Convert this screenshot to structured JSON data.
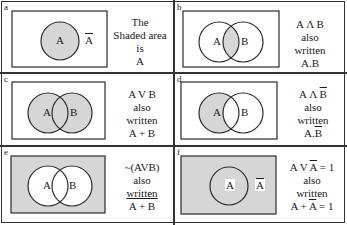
{
  "colors": {
    "shade": "#d6d6d6",
    "line": "#2a2a2a",
    "background": "#ffffff"
  },
  "panels": [
    {
      "id": "a",
      "label": "a",
      "sets": [
        "A"
      ],
      "complement_label": "A",
      "caption": [
        "The",
        "Shaded area",
        "is",
        "A"
      ],
      "shaded": "A"
    },
    {
      "id": "b",
      "label": "b",
      "sets": [
        "A",
        "B"
      ],
      "caption": [
        "A Λ B",
        "also",
        "written",
        "A.B"
      ],
      "shaded": "A∩B"
    },
    {
      "id": "c",
      "label": "c",
      "sets": [
        "A",
        "B"
      ],
      "caption": [
        "A V B",
        "also",
        "written",
        "A + B"
      ],
      "shaded": "A∪B"
    },
    {
      "id": "d",
      "label": "d",
      "sets": [
        "A",
        "B"
      ],
      "caption_parts": {
        "line1_prefix": "A Λ ",
        "line1_bar": "B",
        "line2": "also",
        "line3": "written",
        "line4_prefix": "A.",
        "line4_bar": "B"
      },
      "shaded": "A−B"
    },
    {
      "id": "e",
      "label": "e",
      "sets": [
        "A",
        "B"
      ],
      "caption_parts": {
        "line1": "~(AVB)",
        "line2": "also",
        "line3": "written",
        "line4_bar": "A + B"
      },
      "shaded": "complement of A∪B"
    },
    {
      "id": "f",
      "label": "f",
      "sets": [
        "A"
      ],
      "complement_label": "A",
      "caption_parts": {
        "line1_prefix": "A V ",
        "line1_bar": "A",
        "line1_suffix": " = 1",
        "line2": "also",
        "line3": "written",
        "line4_prefix": "A + ",
        "line4_bar": "A",
        "line4_suffix": " = 1"
      },
      "shaded": "universe"
    }
  ]
}
